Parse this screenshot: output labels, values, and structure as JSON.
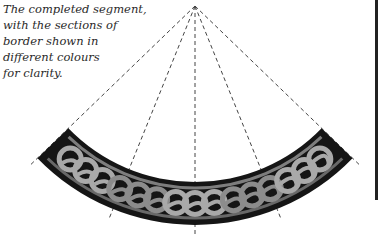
{
  "caption": {
    "lines": [
      "The completed segment,",
      "with the sections of",
      "border shown in",
      "different colours",
      "for clarity."
    ]
  },
  "diagram": {
    "apex": [
      195,
      6
    ],
    "inner_radius": 176,
    "outer_radius": 219,
    "half_angle_deg": 46,
    "guide_angles_deg": [
      -46,
      -22,
      0,
      22,
      46
    ],
    "colors": {
      "band": "#151515",
      "strand_light": "#a9a9a9",
      "strand_mid": "#8c8c8c",
      "guide": "#444444"
    }
  }
}
